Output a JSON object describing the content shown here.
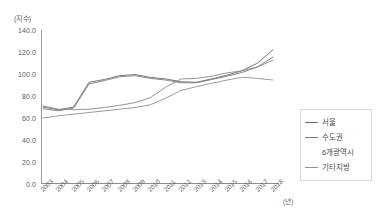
{
  "chart_data": {
    "type": "line",
    "title": "",
    "subtitle": "",
    "xlabel": "(년)",
    "ylabel": "(지수)",
    "x": [
      "2003",
      "2004",
      "2005",
      "2006",
      "2007",
      "2008",
      "2009",
      "2010",
      "2011",
      "2012",
      "2013",
      "2014",
      "2015",
      "2016",
      "2017",
      "2018"
    ],
    "ylim": [
      0.0,
      140.0
    ],
    "yticks": [
      "0.0",
      "20.0",
      "40.0",
      "60.0",
      "80.0",
      "100.0",
      "120.0",
      "140.0"
    ],
    "ytick_values": [
      0.0,
      20.0,
      40.0,
      60.0,
      80.0,
      100.0,
      120.0,
      140.0
    ],
    "grid": false,
    "legend_position": "right",
    "series": [
      {
        "name": "서울",
        "color": "#6b6b6b",
        "values": [
          70.0,
          67.5,
          70.0,
          92.5,
          95.0,
          98.5,
          99.5,
          97.0,
          95.5,
          93.0,
          92.5,
          95.5,
          99.0,
          103.0,
          110.0,
          122.0
        ]
      },
      {
        "name": "수도권",
        "color": "#7a7a7a",
        "values": [
          68.5,
          66.5,
          69.0,
          91.0,
          94.0,
          97.5,
          98.5,
          96.0,
          94.5,
          92.0,
          92.0,
          95.0,
          98.0,
          101.5,
          106.5,
          115.5
        ]
      },
      {
        "name": "6개광역시",
        "color": "#8a8a8a",
        "values": [
          71.0,
          68.0,
          67.5,
          68.0,
          69.5,
          71.5,
          74.0,
          78.5,
          88.0,
          95.5,
          96.0,
          98.0,
          101.0,
          103.0,
          106.5,
          112.5
        ]
      },
      {
        "name": "기타지방",
        "color": "#909090",
        "values": [
          60.0,
          62.0,
          63.5,
          65.0,
          66.5,
          68.0,
          69.5,
          72.0,
          78.0,
          85.0,
          88.5,
          91.5,
          94.5,
          97.0,
          96.0,
          94.5
        ]
      }
    ]
  },
  "axes": {
    "y_unit_label": "(지수)",
    "x_unit_label": "(년)"
  },
  "legend": {
    "items": [
      {
        "label": "서울",
        "color": "#6b6b6b",
        "has_marker": true
      },
      {
        "label": "수도권",
        "color": "#7a7a7a",
        "has_marker": true
      },
      {
        "label": "6개광역시",
        "color": "#8a8a8a",
        "has_marker": false
      },
      {
        "label": "기타지방",
        "color": "#909090",
        "has_marker": true
      }
    ]
  }
}
